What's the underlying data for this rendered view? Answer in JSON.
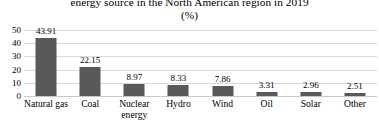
{
  "chart_data": {
    "type": "bar",
    "title": "energy source in the North American region in 2019",
    "title_line1_clipped": "Share of electricity production by",
    "subtitle": "(%)",
    "xlabel": "",
    "ylabel": "",
    "ylim": [
      0,
      50
    ],
    "yticks": [
      50,
      40,
      30,
      20,
      10,
      0
    ],
    "ytick_labels": [
      "50",
      "40",
      "30",
      "20",
      "10",
      "0"
    ],
    "grid": true,
    "legend": "none",
    "bar_color": "#595959",
    "gridline_color": "#d9d9d9",
    "categories": [
      "Natural gas",
      "Coal",
      "Nuclear energy",
      "Hydro",
      "Wind",
      "Oil",
      "Solar",
      "Other"
    ],
    "category_lines": [
      [
        "Natural gas"
      ],
      [
        "Coal"
      ],
      [
        "Nuclear",
        "energy"
      ],
      [
        "Hydro"
      ],
      [
        "Wind"
      ],
      [
        "Oil"
      ],
      [
        "Solar"
      ],
      [
        "Other"
      ]
    ],
    "values": [
      43.91,
      22.15,
      8.97,
      8.33,
      7.86,
      3.31,
      2.96,
      2.51
    ],
    "value_labels": [
      "43.91",
      "22.15",
      "8.97",
      "8.33",
      "7.86",
      "3.31",
      "2.96",
      "2.51"
    ]
  }
}
